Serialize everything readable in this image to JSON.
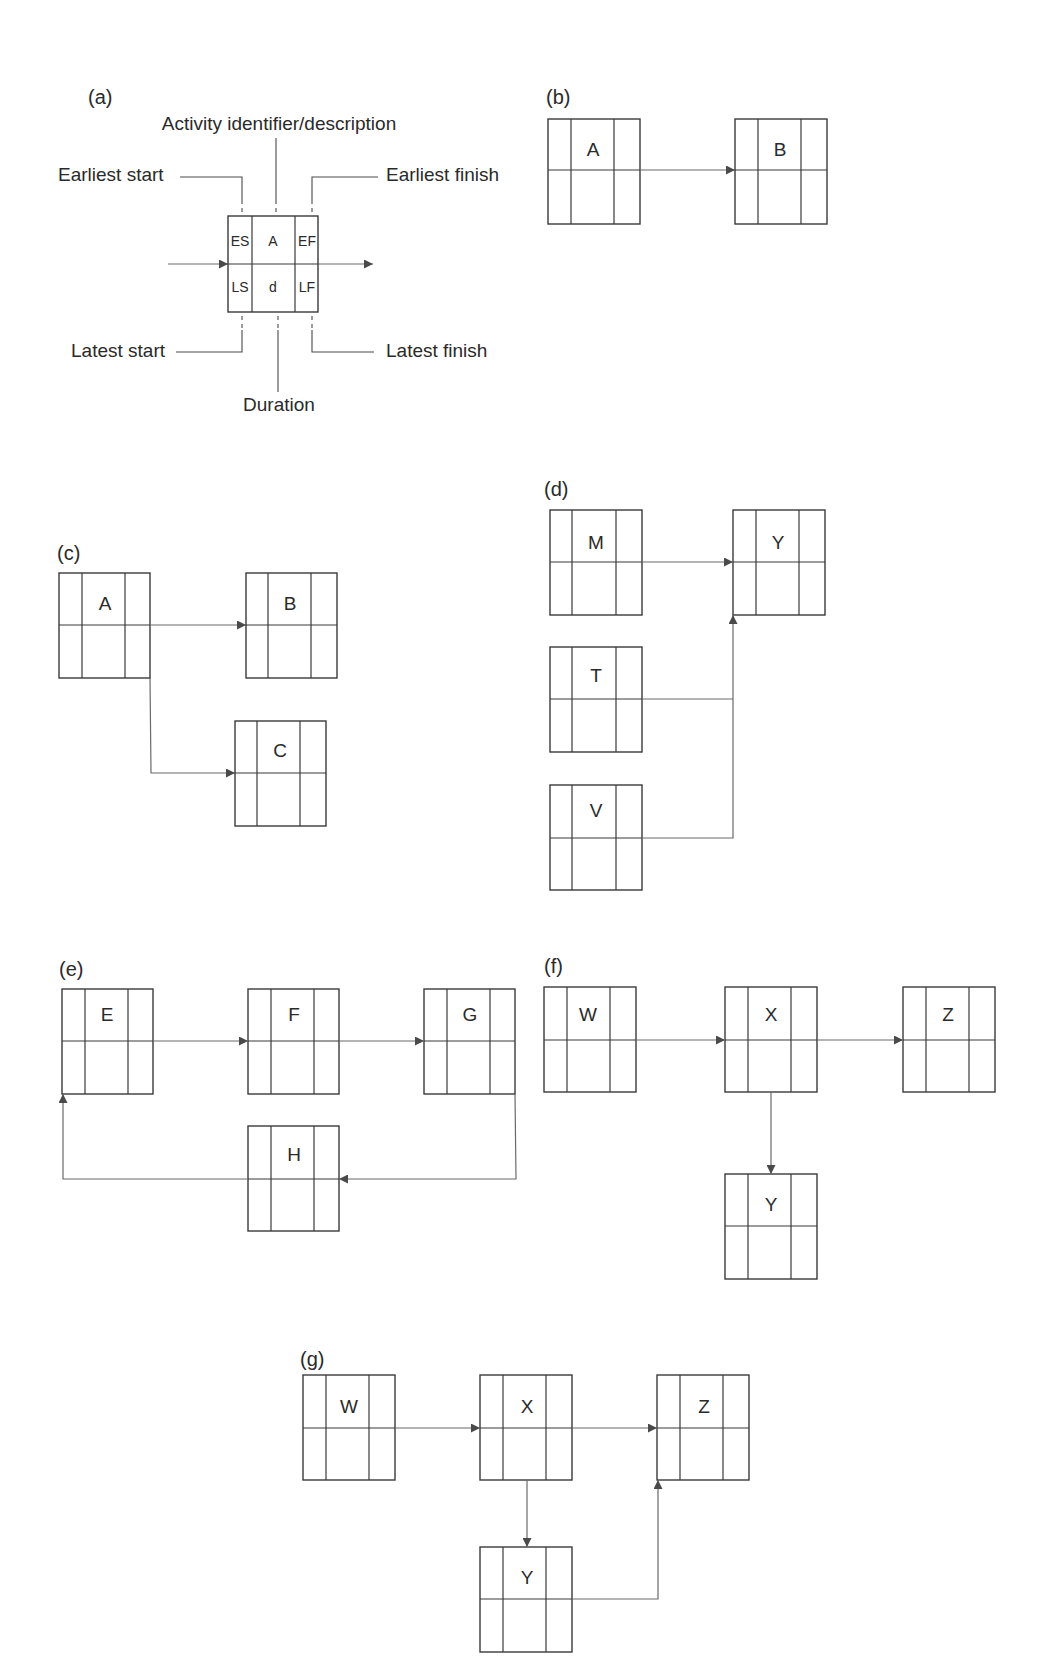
{
  "figure": {
    "panels": {
      "a": {
        "label": "(a)",
        "cells": {
          "es": "ES",
          "id": "A",
          "ef": "EF",
          "ls": "LS",
          "d": "d",
          "lf": "LF"
        },
        "legend": {
          "identifier": "Activity identifier/description",
          "earliest_start": "Earliest start",
          "earliest_finish": "Earliest finish",
          "latest_start": "Latest start",
          "latest_finish": "Latest finish",
          "duration": "Duration"
        }
      },
      "b": {
        "label": "(b)",
        "nodes": [
          "A",
          "B"
        ],
        "edges": [
          [
            "A",
            "B"
          ]
        ]
      },
      "c": {
        "label": "(c)",
        "nodes": [
          "A",
          "B",
          "C"
        ],
        "edges": [
          [
            "A",
            "B"
          ],
          [
            "A",
            "C"
          ]
        ]
      },
      "d": {
        "label": "(d)",
        "nodes": [
          "M",
          "T",
          "V",
          "Y"
        ],
        "edges": [
          [
            "M",
            "Y"
          ],
          [
            "T",
            "Y"
          ],
          [
            "V",
            "Y"
          ]
        ]
      },
      "e": {
        "label": "(e)",
        "nodes": [
          "E",
          "F",
          "G",
          "H"
        ],
        "edges": [
          [
            "E",
            "F"
          ],
          [
            "F",
            "G"
          ],
          [
            "G",
            "H"
          ],
          [
            "H",
            "E"
          ]
        ]
      },
      "f": {
        "label": "(f)",
        "nodes": [
          "W",
          "X",
          "Z",
          "Y"
        ],
        "edges": [
          [
            "W",
            "X"
          ],
          [
            "X",
            "Z"
          ],
          [
            "X",
            "Y"
          ]
        ]
      },
      "g": {
        "label": "(g)",
        "nodes": [
          "W",
          "X",
          "Z",
          "Y"
        ],
        "edges": [
          [
            "W",
            "X"
          ],
          [
            "X",
            "Z"
          ],
          [
            "X",
            "Y"
          ],
          [
            "Y",
            "Z"
          ]
        ]
      }
    }
  }
}
